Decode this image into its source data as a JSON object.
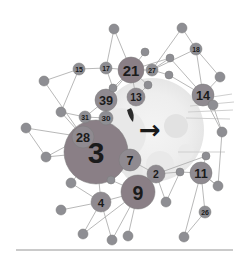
{
  "figure": {
    "title": "",
    "background_color": "#ffffff",
    "divider_color": "#b9b9b9",
    "center_arrow_glyph": "→",
    "center_arrow_color": "#1a1a1a",
    "overlay_circle_color": "#efefef",
    "overlay_blob_color": "#e4e4e4",
    "ray_color": "#cfcfcf"
  },
  "chart_data": {
    "type": "scatter",
    "title": "",
    "subtitle": "",
    "xlabel": "",
    "ylabel": "",
    "grid": false,
    "legend": "none",
    "node_fill_large": "#8a7f86",
    "node_fill_medium": "#8f8a90",
    "node_fill_small": "#8e8e93",
    "edge_color": "#b0b0b0",
    "nodes": [
      {
        "id": "n3",
        "label": "3",
        "x": 96,
        "y": 152,
        "r": 32,
        "size": "xl",
        "labeled": true
      },
      {
        "id": "n9",
        "label": "9",
        "x": 138,
        "y": 192,
        "r": 17,
        "size": "large",
        "labeled": true
      },
      {
        "id": "n21",
        "label": "21",
        "x": 131,
        "y": 70,
        "r": 13,
        "size": "large",
        "labeled": true
      },
      {
        "id": "n39",
        "label": "39",
        "x": 106,
        "y": 100,
        "r": 11,
        "size": "medium",
        "labeled": true
      },
      {
        "id": "n28",
        "label": "28",
        "x": 83,
        "y": 137,
        "r": 11,
        "size": "medium",
        "labeled": true
      },
      {
        "id": "n14",
        "label": "14",
        "x": 203,
        "y": 95,
        "r": 11,
        "size": "medium",
        "labeled": true
      },
      {
        "id": "n11",
        "label": "11",
        "x": 201,
        "y": 173,
        "r": 11,
        "size": "medium",
        "labeled": true
      },
      {
        "id": "n7",
        "label": "7",
        "x": 130,
        "y": 160,
        "r": 11,
        "size": "medium",
        "labeled": true
      },
      {
        "id": "n4",
        "label": "4",
        "x": 101,
        "y": 202,
        "r": 10,
        "size": "medium",
        "labeled": true
      },
      {
        "id": "n13",
        "label": "13",
        "x": 136,
        "y": 97,
        "r": 9,
        "size": "medium",
        "labeled": true
      },
      {
        "id": "n2",
        "label": "2",
        "x": 156,
        "y": 174,
        "r": 9,
        "size": "medium",
        "labeled": true
      },
      {
        "id": "n30",
        "label": "30",
        "x": 106,
        "y": 118,
        "r": 7,
        "size": "small",
        "labeled": true
      },
      {
        "id": "n31",
        "label": "31",
        "x": 85,
        "y": 117,
        "r": 6,
        "size": "small",
        "labeled": true
      },
      {
        "id": "n15",
        "label": "15",
        "x": 79,
        "y": 69,
        "r": 6,
        "size": "small",
        "labeled": true
      },
      {
        "id": "n17",
        "label": "17",
        "x": 106,
        "y": 68,
        "r": 6,
        "size": "small",
        "labeled": true
      },
      {
        "id": "n18",
        "label": "18",
        "x": 196,
        "y": 49,
        "r": 6,
        "size": "small",
        "labeled": true
      },
      {
        "id": "n26",
        "label": "26",
        "x": 205,
        "y": 212,
        "r": 6,
        "size": "small",
        "labeled": true
      },
      {
        "id": "n27",
        "label": "27",
        "x": 152,
        "y": 70,
        "r": 6,
        "size": "small",
        "labeled": true
      },
      {
        "id": "a1",
        "label": "",
        "x": 114,
        "y": 29,
        "r": 5,
        "size": "small",
        "labeled": false
      },
      {
        "id": "a2",
        "label": "",
        "x": 145,
        "y": 52,
        "r": 4,
        "size": "small",
        "labeled": false
      },
      {
        "id": "a3",
        "label": "",
        "x": 182,
        "y": 28,
        "r": 5,
        "size": "small",
        "labeled": false
      },
      {
        "id": "a4",
        "label": "",
        "x": 169,
        "y": 75,
        "r": 4,
        "size": "small",
        "labeled": false
      },
      {
        "id": "a5",
        "label": "",
        "x": 113,
        "y": 88,
        "r": 4,
        "size": "small",
        "labeled": false
      },
      {
        "id": "a6",
        "label": "",
        "x": 44,
        "y": 81,
        "r": 5,
        "size": "small",
        "labeled": false
      },
      {
        "id": "a7",
        "label": "",
        "x": 61,
        "y": 112,
        "r": 5,
        "size": "small",
        "labeled": false
      },
      {
        "id": "a8",
        "label": "",
        "x": 26,
        "y": 128,
        "r": 5,
        "size": "small",
        "labeled": false
      },
      {
        "id": "a9",
        "label": "",
        "x": 46,
        "y": 157,
        "r": 5,
        "size": "small",
        "labeled": false
      },
      {
        "id": "a10",
        "label": "",
        "x": 71,
        "y": 183,
        "r": 5,
        "size": "small",
        "labeled": false
      },
      {
        "id": "a11",
        "label": "",
        "x": 61,
        "y": 210,
        "r": 5,
        "size": "small",
        "labeled": false
      },
      {
        "id": "a12",
        "label": "",
        "x": 83,
        "y": 234,
        "r": 5,
        "size": "small",
        "labeled": false
      },
      {
        "id": "a13",
        "label": "",
        "x": 112,
        "y": 240,
        "r": 5,
        "size": "small",
        "labeled": false
      },
      {
        "id": "a14",
        "label": "",
        "x": 128,
        "y": 236,
        "r": 5,
        "size": "small",
        "labeled": false
      },
      {
        "id": "a15",
        "label": "",
        "x": 166,
        "y": 202,
        "r": 5,
        "size": "small",
        "labeled": false
      },
      {
        "id": "a16",
        "label": "",
        "x": 184,
        "y": 237,
        "r": 5,
        "size": "small",
        "labeled": false
      },
      {
        "id": "a17",
        "label": "",
        "x": 218,
        "y": 186,
        "r": 5,
        "size": "small",
        "labeled": false
      },
      {
        "id": "a18",
        "label": "",
        "x": 222,
        "y": 132,
        "r": 5,
        "size": "small",
        "labeled": false
      },
      {
        "id": "a19",
        "label": "",
        "x": 213,
        "y": 105,
        "r": 5,
        "size": "small",
        "labeled": false
      },
      {
        "id": "a20",
        "label": "",
        "x": 220,
        "y": 77,
        "r": 5,
        "size": "small",
        "labeled": false
      },
      {
        "id": "a21",
        "label": "",
        "x": 206,
        "y": 156,
        "r": 4,
        "size": "small",
        "labeled": false
      },
      {
        "id": "a22",
        "label": "",
        "x": 180,
        "y": 172,
        "r": 4,
        "size": "small",
        "labeled": false
      },
      {
        "id": "a23",
        "label": "",
        "x": 111,
        "y": 180,
        "r": 4,
        "size": "small",
        "labeled": false
      },
      {
        "id": "a24",
        "label": "",
        "x": 148,
        "y": 85,
        "r": 4,
        "size": "small",
        "labeled": false
      },
      {
        "id": "a25",
        "label": "",
        "x": 170,
        "y": 58,
        "r": 4,
        "size": "small",
        "labeled": false
      }
    ],
    "edges": [
      [
        "n21",
        "a1"
      ],
      [
        "n21",
        "a2"
      ],
      [
        "n21",
        "n17"
      ],
      [
        "n21",
        "n13"
      ],
      [
        "n21",
        "n27"
      ],
      [
        "n21",
        "a24"
      ],
      [
        "n21",
        "a5"
      ],
      [
        "n21",
        "n39"
      ],
      [
        "n21",
        "a25"
      ],
      [
        "n27",
        "a3"
      ],
      [
        "n27",
        "a4"
      ],
      [
        "n27",
        "n18"
      ],
      [
        "n27",
        "a25"
      ],
      [
        "n18",
        "a3"
      ],
      [
        "n18",
        "n14"
      ],
      [
        "n18",
        "a20"
      ],
      [
        "n14",
        "a20"
      ],
      [
        "n14",
        "a19"
      ],
      [
        "n14",
        "a4"
      ],
      [
        "n14",
        "a18"
      ],
      [
        "a19",
        "a18"
      ],
      [
        "a18",
        "a17"
      ],
      [
        "a17",
        "n11"
      ],
      [
        "n11",
        "a21"
      ],
      [
        "n11",
        "a16"
      ],
      [
        "n11",
        "n26"
      ],
      [
        "n26",
        "a16"
      ],
      [
        "n11",
        "a22"
      ],
      [
        "a22",
        "n2"
      ],
      [
        "n2",
        "n7"
      ],
      [
        "n2",
        "a15"
      ],
      [
        "n2",
        "n9"
      ],
      [
        "n9",
        "a23"
      ],
      [
        "n9",
        "a13"
      ],
      [
        "n9",
        "a14"
      ],
      [
        "n9",
        "a12"
      ],
      [
        "n9",
        "n4"
      ],
      [
        "n4",
        "a11"
      ],
      [
        "n4",
        "a10"
      ],
      [
        "n4",
        "a12"
      ],
      [
        "n4",
        "a13"
      ],
      [
        "n3",
        "n4"
      ],
      [
        "n3",
        "n28"
      ],
      [
        "n3",
        "n7"
      ],
      [
        "n3",
        "a10"
      ],
      [
        "n3",
        "a9"
      ],
      [
        "n28",
        "a7"
      ],
      [
        "n28",
        "a8"
      ],
      [
        "n28",
        "a9"
      ],
      [
        "n28",
        "a6"
      ],
      [
        "n28",
        "n31"
      ],
      [
        "a6",
        "n15"
      ],
      [
        "n15",
        "n17"
      ],
      [
        "n15",
        "a7"
      ],
      [
        "n17",
        "a5"
      ],
      [
        "n39",
        "n30"
      ],
      [
        "n39",
        "a5"
      ],
      [
        "n30",
        "n31"
      ],
      [
        "n31",
        "a7"
      ],
      [
        "n39",
        "n31"
      ],
      [
        "n7",
        "a23"
      ],
      [
        "a8",
        "a9"
      ],
      [
        "n13",
        "a24"
      ],
      [
        "a15",
        "a22"
      ],
      [
        "n3",
        "a23"
      ],
      [
        "n14",
        "a25"
      ],
      [
        "a1",
        "n17"
      ],
      [
        "n11",
        "a17"
      ],
      [
        "n2",
        "a21"
      ]
    ]
  },
  "elements": {
    "divider_label": "",
    "overlay_label": ""
  }
}
